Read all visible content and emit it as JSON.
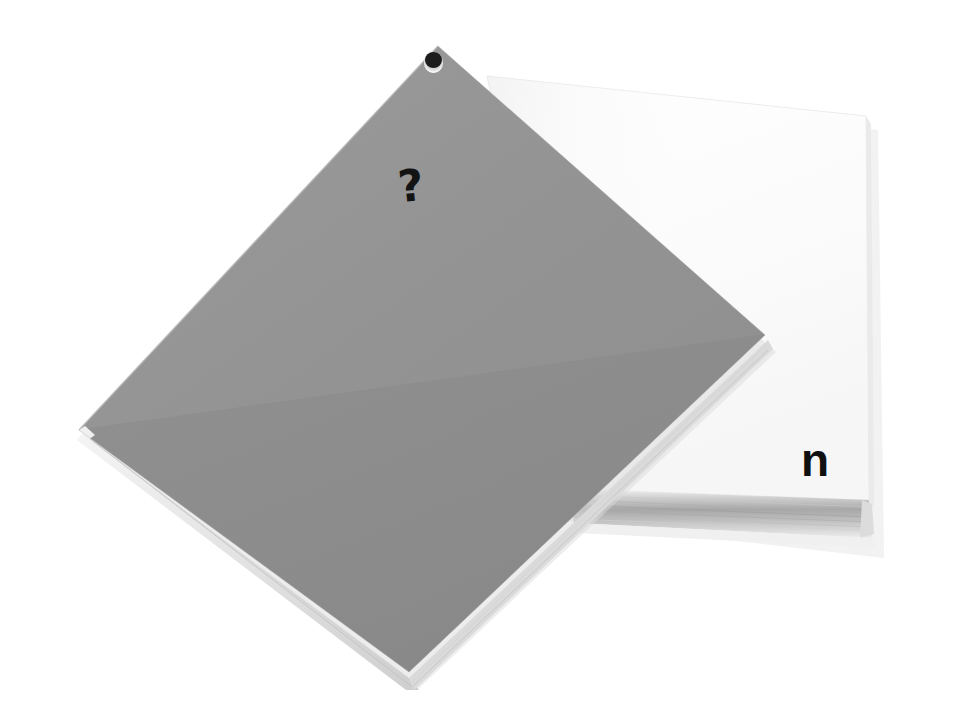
{
  "scene": {
    "title": "Gray diamond sheet resting on a stack of white paper",
    "width": 962,
    "height": 717,
    "background_color": "#ffffff"
  },
  "objects": {
    "paper_stack": {
      "name": "white paper stack",
      "label": "n",
      "face_color": "#fdfdfd",
      "edge_color": "#d9d9d9",
      "block_shadow_color": "#b8b8b8",
      "sheet_count_visible": 7
    },
    "gray_sheet": {
      "name": "gray diamond sheet",
      "label": "?",
      "face_color": "#909090",
      "face_color_light": "#989898",
      "face_color_dark": "#8a8a8a",
      "edge_color": "#e4e4e4",
      "rim_color": "#c9c9c9",
      "hole_color": "#1d1d1d",
      "hole_bore_color": "#d6d6d6"
    }
  },
  "marks": {
    "question": "?",
    "letter_n": "n"
  },
  "palette": {
    "background": "#ffffff",
    "gray_face": "#909090",
    "paper_white": "#fdfdfd",
    "ink_black": "#141414",
    "soft_shadow": "#ededed"
  }
}
